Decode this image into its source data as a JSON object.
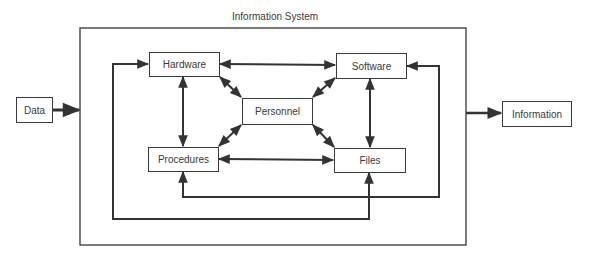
{
  "diagram": {
    "title": "Information System",
    "input": "Data",
    "output": "Information",
    "components": {
      "hardware": "Hardware",
      "software": "Software",
      "personnel": "Personnel",
      "procedures": "Procedures",
      "files": "Files"
    },
    "connections": [
      {
        "from": "Data",
        "to": "Information System",
        "type": "one-way"
      },
      {
        "from": "Information System",
        "to": "Information",
        "type": "one-way"
      },
      {
        "from": "Hardware",
        "to": "Software",
        "type": "two-way"
      },
      {
        "from": "Hardware",
        "to": "Procedures",
        "type": "two-way"
      },
      {
        "from": "Software",
        "to": "Files",
        "type": "two-way"
      },
      {
        "from": "Procedures",
        "to": "Files",
        "type": "two-way"
      },
      {
        "from": "Hardware",
        "to": "Personnel",
        "type": "two-way"
      },
      {
        "from": "Software",
        "to": "Personnel",
        "type": "two-way"
      },
      {
        "from": "Procedures",
        "to": "Personnel",
        "type": "two-way"
      },
      {
        "from": "Files",
        "to": "Personnel",
        "type": "two-way"
      },
      {
        "from": "Procedures",
        "to": "Software",
        "type": "feedback-loop"
      },
      {
        "from": "Hardware",
        "to": "Files",
        "type": "feedback-loop"
      }
    ],
    "colors": {
      "line": "#333333",
      "text": "#3a3a3a",
      "background": "#ffffff"
    }
  }
}
